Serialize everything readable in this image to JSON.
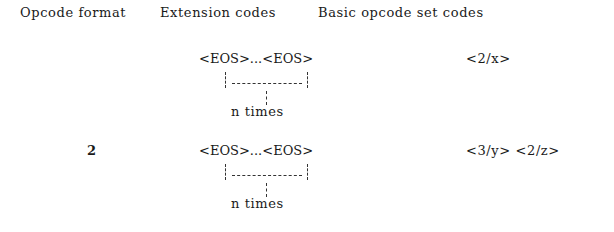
{
  "headers": {
    "opcode_format": "Opcode format",
    "extension_codes": "Extension codes",
    "basic_opcode_set_codes": "Basic opcode set codes"
  },
  "rows": [
    {
      "opcode_format": "",
      "extension": {
        "first": "<EOS>",
        "dots": "...",
        "last": "<EOS>",
        "repeat_label": "n times"
      },
      "basic_codes": "<2/x>"
    },
    {
      "opcode_format": "2",
      "extension": {
        "first": "<EOS>",
        "dots": "...",
        "last": "<EOS>",
        "repeat_label": "n times"
      },
      "basic_codes": "<3/y> <2/z>"
    }
  ]
}
